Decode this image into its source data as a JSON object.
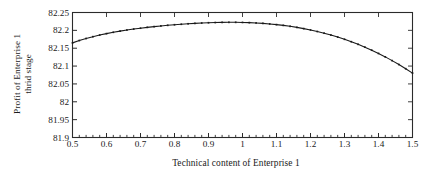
{
  "chart_data": {
    "type": "line",
    "title": "",
    "xlabel": "Technical content of Enterprise 1",
    "ylabel_line1": "Profit of Enterprise 1",
    "ylabel_line2": "thrid stage",
    "xlim": [
      0.5,
      1.5
    ],
    "ylim": [
      81.9,
      82.25
    ],
    "grid": false,
    "legend": null,
    "line_color": "#1a1a1a",
    "marker": "dot",
    "xticks": [
      0.5,
      0.6,
      0.7,
      0.8,
      0.9,
      1.0,
      1.1,
      1.2,
      1.3,
      1.4,
      1.5
    ],
    "xtick_labels": [
      "0.5",
      "0.6",
      "0.7",
      "0.8",
      "0.9",
      "1",
      "1.1",
      "1.2",
      "1.3",
      "1.4",
      "1.5"
    ],
    "x_minor_tick_step": 0.02,
    "yticks": [
      81.9,
      81.95,
      82.0,
      82.05,
      82.1,
      82.15,
      82.2,
      82.25
    ],
    "ytick_labels": [
      "81.9",
      "81.95",
      "82",
      "82.05",
      "82.1",
      "82.15",
      "82.2",
      "82.25"
    ],
    "series": [
      {
        "name": "Profit of Enterprise 1 third stage",
        "x": [
          0.5,
          0.52,
          0.54,
          0.56,
          0.58,
          0.6,
          0.62,
          0.64,
          0.66,
          0.68,
          0.7,
          0.72,
          0.74,
          0.76,
          0.78,
          0.8,
          0.82,
          0.84,
          0.86,
          0.88,
          0.9,
          0.92,
          0.94,
          0.96,
          0.98,
          1.0,
          1.02,
          1.04,
          1.06,
          1.08,
          1.1,
          1.12,
          1.14,
          1.16,
          1.18,
          1.2,
          1.22,
          1.24,
          1.26,
          1.28,
          1.3,
          1.32,
          1.34,
          1.36,
          1.38,
          1.4,
          1.42,
          1.44,
          1.46,
          1.48,
          1.5
        ],
        "values": [
          82.165,
          82.1715,
          82.1772,
          82.1823,
          82.1868,
          82.1909,
          82.1946,
          82.1979,
          82.2009,
          82.2036,
          82.2061,
          82.2084,
          82.2105,
          82.2124,
          82.2141,
          82.2157,
          82.2171,
          82.2184,
          82.2195,
          82.2205,
          82.2213,
          82.2219,
          82.2223,
          82.2225,
          82.2225,
          82.2222,
          82.2216,
          82.2207,
          82.2195,
          82.218,
          82.2161,
          82.2139,
          82.2113,
          82.2083,
          82.2049,
          82.2011,
          82.1968,
          82.1921,
          82.1869,
          82.1812,
          82.175,
          82.1682,
          82.1609,
          82.153,
          82.1445,
          82.1354,
          82.1257,
          82.1153,
          82.1043,
          82.0926,
          82.0803
        ]
      }
    ]
  },
  "axes": {
    "frame_color": "#2b2b2b",
    "background": "#ffffff"
  }
}
